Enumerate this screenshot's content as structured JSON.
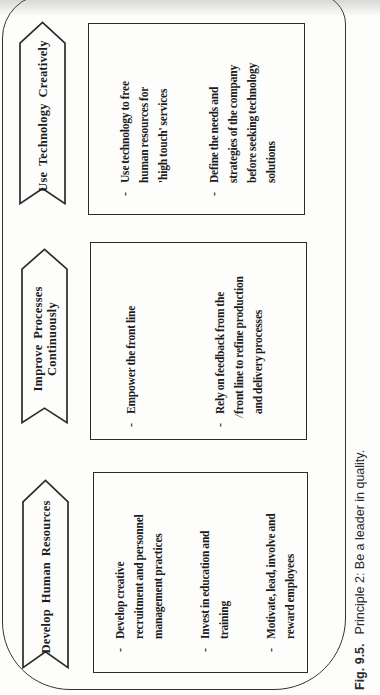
{
  "figure": {
    "caption_label": "Fig. 9.5.",
    "caption_text": "Principle 2: Be a leader in quality.",
    "bullet_marker": "-",
    "slash_artifact": "/",
    "colors": {
      "ink": "#1c1c1c",
      "paper": "#fdfdfb",
      "line": "#2a2a2a"
    },
    "columns": [
      {
        "banner": "Develop Human Resources",
        "bullets": [
          "Develop creative\nrecruitment and personnel\nmanagement practices",
          "Invest in education and\ntraining",
          "Motivate, lead, involve and\nreward employees"
        ]
      },
      {
        "banner": "Improve Processes\nContinuously",
        "bullets": [
          "Empower the front line",
          "Rely on feedback from the\nfront line to refine production\nand delivery processes"
        ]
      },
      {
        "banner": "Use Technology Creatively",
        "bullets": [
          "Use technology to free\nhuman resources for\n'high touch' services",
          "Define the needs and\nstrategies of the company\nbefore seeking technology\nsolutions"
        ]
      }
    ]
  }
}
